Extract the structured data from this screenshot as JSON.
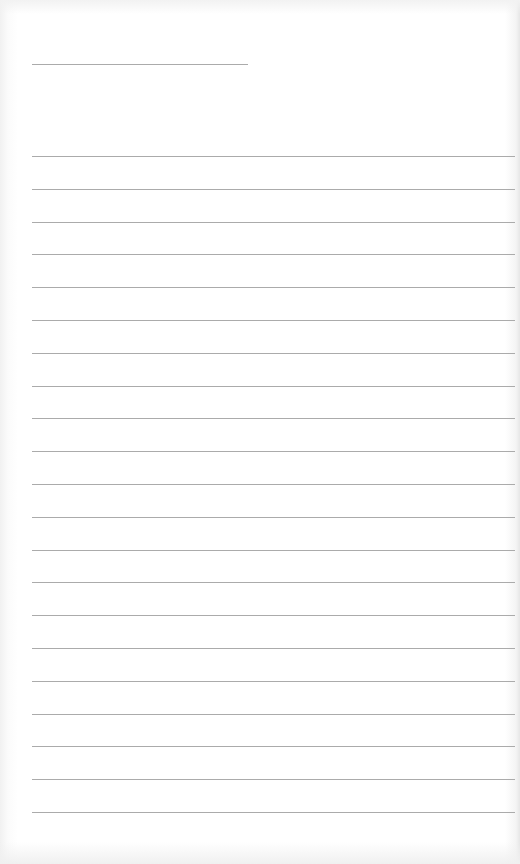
{
  "page": {
    "type": "blank-lined-paper",
    "background_color": "#ffffff",
    "line_color": "#ababab",
    "header_line": {
      "left": 32,
      "top": 64,
      "width": 216
    },
    "ruled_lines": {
      "count": 21,
      "left": 32,
      "width": 483,
      "first_top": 156,
      "spacing": 32.8
    }
  }
}
